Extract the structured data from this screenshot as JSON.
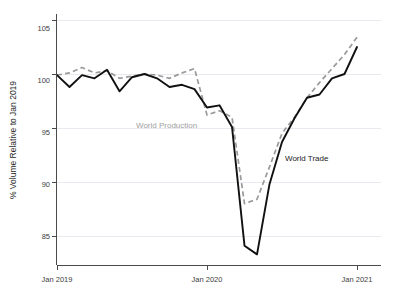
{
  "chart_data": {
    "type": "line",
    "title": "",
    "xlabel": "",
    "ylabel": "% Volume Relative to Jan 2019",
    "ylim": [
      82.5,
      106
    ],
    "xlim": [
      "Jan 2019",
      "Jan 2021"
    ],
    "grid": true,
    "legend_position": "inline-annotation",
    "y_ticks": [
      85,
      90,
      95,
      100,
      105
    ],
    "y_tick_labels": [
      "85",
      "90",
      "95",
      "100",
      "105"
    ],
    "x_ticks": [
      "Jan 2019",
      "Jan 2020",
      "Jan 2021"
    ],
    "x_tick_labels": [
      "Jan 2019",
      "Jan 2020",
      "Jan 2021"
    ],
    "x": [
      "Jan 2019",
      "Feb 2019",
      "Mar 2019",
      "Apr 2019",
      "May 2019",
      "Jun 2019",
      "Jul 2019",
      "Aug 2019",
      "Sep 2019",
      "Oct 2019",
      "Nov 2019",
      "Dec 2019",
      "Jan 2020",
      "Feb 2020",
      "Mar 2020",
      "Apr 2020",
      "May 2020",
      "Jun 2020",
      "Jul 2020",
      "Aug 2020",
      "Sep 2020",
      "Oct 2020",
      "Nov 2020",
      "Dec 2020",
      "Jan 2021"
    ],
    "series": [
      {
        "name": "World Trade",
        "color": "#111111",
        "style": "solid",
        "values": [
          99.9,
          98.8,
          99.9,
          99.6,
          100.4,
          98.4,
          99.7,
          100.0,
          99.6,
          98.8,
          99.0,
          98.6,
          96.9,
          97.1,
          95.1,
          84.1,
          83.3,
          89.8,
          93.7,
          95.9,
          97.8,
          98.1,
          99.6,
          100.0,
          102.5
        ]
      },
      {
        "name": "World Production",
        "color": "#9a9a9a",
        "style": "dashed",
        "values": [
          99.9,
          100.1,
          100.6,
          100.1,
          100.3,
          99.6,
          99.8,
          100.0,
          99.9,
          99.6,
          100.1,
          100.5,
          96.2,
          96.6,
          96.0,
          88.0,
          88.4,
          91.4,
          94.5,
          96.0,
          97.8,
          99.2,
          100.5,
          101.8,
          103.4
        ]
      }
    ],
    "annotations": [
      {
        "text": "World Production",
        "series": "World Production",
        "x_px": 175,
        "y_px": 125,
        "color": "#a0a0a0"
      },
      {
        "text": "World Trade",
        "series": "World Trade",
        "x_px": 310,
        "y_px": 159,
        "color": "#1a1a1a"
      }
    ]
  },
  "axes": {
    "y_title": "% Volume Relative to Jan 2019",
    "y_tick_0": "85",
    "y_tick_1": "90",
    "y_tick_2": "95",
    "y_tick_3": "100",
    "y_tick_4": "105",
    "x_tick_0": "Jan 2019",
    "x_tick_1": "Jan 2020",
    "x_tick_2": "Jan 2021"
  },
  "annotations": {
    "production_label": "World Production",
    "trade_label": "World Trade"
  },
  "colors": {
    "trade": "#111111",
    "production": "#9a9a9a",
    "axis": "#4a4a4a",
    "grid": "#e9e9ef",
    "background": "#ffffff"
  }
}
